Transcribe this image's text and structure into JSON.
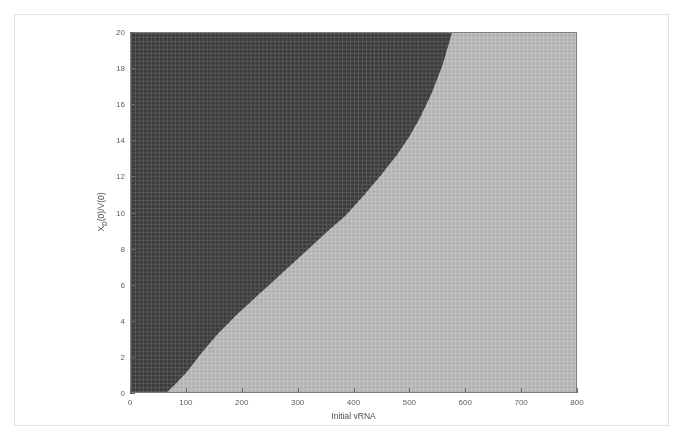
{
  "figure": {
    "background_color": "#ffffff",
    "frame_color": "#e2e2e2"
  },
  "chart_data": {
    "type": "heatmap",
    "title": "",
    "subtitle": "",
    "xlabel": "Initial vRNA",
    "ylabel": "X_D(0)/V(0)",
    "ylabel_base": "X",
    "ylabel_sub": "D",
    "ylabel_rest": "(0)/V(0)",
    "xlim": [
      0,
      800
    ],
    "ylim": [
      0,
      20
    ],
    "xticks": [
      0,
      100,
      200,
      300,
      400,
      500,
      600,
      700,
      800
    ],
    "yticks": [
      0,
      2,
      4,
      6,
      8,
      10,
      12,
      14,
      16,
      18,
      20
    ],
    "xtick_labels": [
      "0",
      "100",
      "200",
      "300",
      "400",
      "500",
      "600",
      "700",
      "800"
    ],
    "ytick_labels": [
      "0",
      "2",
      "4",
      "6",
      "8",
      "10",
      "12",
      "14",
      "16",
      "18",
      "20"
    ],
    "grid": true,
    "grid_style": "dense mesh lattice overlay on both regions",
    "legend": "none",
    "annotations": [],
    "regions": [
      {
        "name": "dark-region",
        "label": "upper-left region",
        "color": "#3b3b3b",
        "position": "above-left of boundary curve"
      },
      {
        "name": "light-region",
        "label": "lower-right region",
        "color": "#b2b2b2",
        "position": "below-right of boundary curve"
      }
    ],
    "boundary_curve": {
      "name": "separatrix",
      "description": "monotonically increasing concave-right boundary separating dark upper-left region from light lower-right region",
      "x": [
        65,
        80,
        100,
        125,
        155,
        190,
        225,
        250,
        285,
        320,
        355,
        385,
        420,
        450,
        478,
        500,
        520,
        540,
        560,
        577
      ],
      "y": [
        0.0,
        0.45,
        1.1,
        2.1,
        3.2,
        4.3,
        5.3,
        6.0,
        7.0,
        8.0,
        9.0,
        9.8,
        11.0,
        12.1,
        13.2,
        14.2,
        15.3,
        16.6,
        18.2,
        20.0
      ]
    }
  }
}
